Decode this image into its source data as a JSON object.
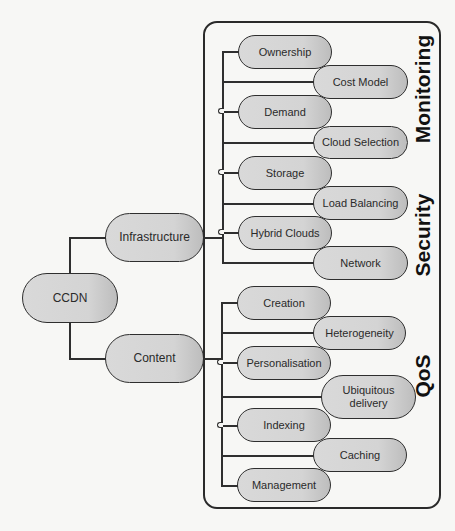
{
  "diagram": {
    "root": {
      "label": "CCDN"
    },
    "branches": [
      {
        "label": "Infrastructure",
        "children": [
          "Ownership",
          "Cost Model",
          "Demand",
          "Cloud Selection",
          "Storage",
          "Load Balancing",
          "Hybrid Clouds",
          "Network"
        ]
      },
      {
        "label": "Content",
        "children": [
          "Creation",
          "Heterogeneity",
          "Personalisation",
          "Ubiquitous delivery",
          "Indexing",
          "Caching",
          "Management"
        ]
      }
    ],
    "cross_cutting": [
      "Monitoring",
      "Security",
      "QoS"
    ],
    "colors": {
      "node_fill": "#d4d4d4",
      "stroke": "#2e2e2e",
      "background": "#f7f7f5"
    }
  }
}
